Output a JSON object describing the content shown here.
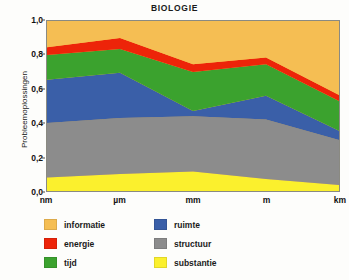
{
  "chart_data": {
    "type": "area",
    "title": "BIOLOGIE",
    "xlabel": "",
    "ylabel": "Probleemoplossingen",
    "stacked": true,
    "normalized": true,
    "grid": false,
    "legend_position": "bottom-left",
    "categories": [
      "nm",
      "µm",
      "mm",
      "m",
      "km"
    ],
    "ylim": [
      0.0,
      1.0
    ],
    "y_ticks": [
      {
        "value": 0.0,
        "label": "0,0"
      },
      {
        "value": 0.2,
        "label": "0,2"
      },
      {
        "value": 0.4,
        "label": "0,4"
      },
      {
        "value": 0.6,
        "label": "0,6"
      },
      {
        "value": 0.8,
        "label": "0,8"
      },
      {
        "value": 1.0,
        "label": "1,0"
      }
    ],
    "series": [
      {
        "name": "substantie",
        "color": "#fbf02d",
        "values": [
          0.08,
          0.1,
          0.115,
          0.07,
          0.035
        ]
      },
      {
        "name": "structuur",
        "color": "#8c8c8c",
        "values": [
          0.32,
          0.33,
          0.325,
          0.35,
          0.265
        ]
      },
      {
        "name": "ruimte",
        "color": "#3a5fa8",
        "values": [
          0.255,
          0.265,
          0.03,
          0.14,
          0.055
        ]
      },
      {
        "name": "tijd",
        "color": "#3ba22e",
        "values": [
          0.145,
          0.14,
          0.23,
          0.185,
          0.175
        ]
      },
      {
        "name": "energie",
        "color": "#ed2409",
        "values": [
          0.045,
          0.065,
          0.045,
          0.04,
          0.035
        ]
      },
      {
        "name": "informatie",
        "color": "#f5be53",
        "values": [
          0.155,
          0.1,
          0.255,
          0.215,
          0.435
        ]
      }
    ],
    "cumulative_tops": {
      "substantie": [
        0.08,
        0.1,
        0.115,
        0.07,
        0.035
      ],
      "structuur": [
        0.4,
        0.43,
        0.44,
        0.42,
        0.3
      ],
      "ruimte": [
        0.655,
        0.695,
        0.47,
        0.56,
        0.355
      ],
      "tijd": [
        0.8,
        0.835,
        0.7,
        0.745,
        0.53
      ],
      "energie": [
        0.845,
        0.9,
        0.745,
        0.785,
        0.565
      ],
      "informatie": [
        1.0,
        1.0,
        1.0,
        1.0,
        1.0
      ]
    }
  },
  "legend": {
    "entries": [
      {
        "label": "informatie",
        "color": "#f5be53"
      },
      {
        "label": "ruimte",
        "color": "#3a5fa8"
      },
      {
        "label": "energie",
        "color": "#ed2409"
      },
      {
        "label": "structuur",
        "color": "#8c8c8c"
      },
      {
        "label": "tijd",
        "color": "#3ba22e"
      },
      {
        "label": "substantie",
        "color": "#fbf02d"
      }
    ]
  }
}
